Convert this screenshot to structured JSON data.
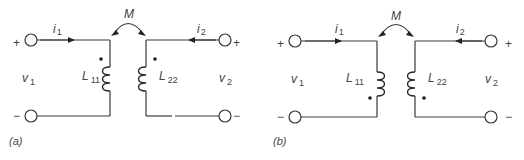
{
  "figure": {
    "panels": [
      {
        "id": "a",
        "caption": "(a)",
        "mutual_label": "M",
        "current_left": {
          "sym": "i",
          "sub": "1"
        },
        "current_right": {
          "sym": "i",
          "sub": "2"
        },
        "voltage_left": {
          "sym": "v",
          "sub": "1"
        },
        "voltage_right": {
          "sym": "v",
          "sub": "2"
        },
        "inductor_left": {
          "sym": "L",
          "sub": "11"
        },
        "inductor_right": {
          "sym": "L",
          "sub": "22"
        },
        "plus": "+",
        "minus": "−",
        "dot_position": "top"
      },
      {
        "id": "b",
        "caption": "(b)",
        "mutual_label": "M",
        "current_left": {
          "sym": "i",
          "sub": "1"
        },
        "current_right": {
          "sym": "i",
          "sub": "2"
        },
        "voltage_left": {
          "sym": "v",
          "sub": "1"
        },
        "voltage_right": {
          "sym": "v",
          "sub": "2"
        },
        "inductor_left": {
          "sym": "L",
          "sub": "11"
        },
        "inductor_right": {
          "sym": "L",
          "sub": "22"
        },
        "plus": "+",
        "minus": "−",
        "dot_position": "bottom"
      }
    ],
    "colors": {
      "line": "#3a3a3a",
      "text": "#444444",
      "background": "#ffffff"
    }
  }
}
